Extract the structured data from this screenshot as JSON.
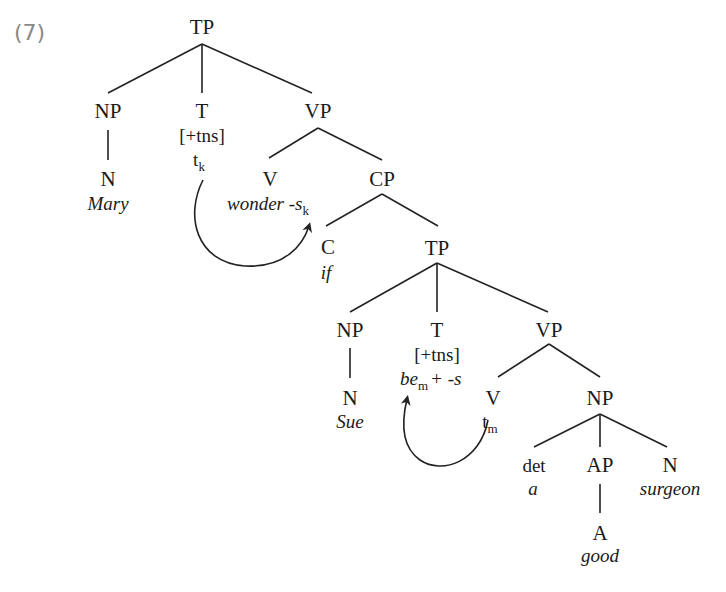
{
  "example": {
    "number": "(7)",
    "color": "#8a8a8a"
  },
  "tree": {
    "root": {
      "label": "TP"
    },
    "np1": {
      "label": "NP",
      "n": "N",
      "word": "Mary"
    },
    "t1": {
      "label": "T",
      "feature": "[+tns]",
      "trace": "t",
      "trace_index": "k"
    },
    "vp1": {
      "label": "VP"
    },
    "v1": {
      "label": "V",
      "word": "wonder -s",
      "word_index": "k"
    },
    "cp": {
      "label": "CP"
    },
    "c": {
      "label": "C",
      "word": "if"
    },
    "tp2": {
      "label": "TP"
    },
    "np2": {
      "label": "NP",
      "n": "N",
      "word": "Sue"
    },
    "t2": {
      "label": "T",
      "feature": "[+tns]",
      "word_be": "be",
      "word_index": "m",
      "word_suffix": "+ -s"
    },
    "vp2": {
      "label": "VP"
    },
    "v2": {
      "label": "V",
      "trace": "t",
      "trace_index": "m"
    },
    "np3": {
      "label": "NP"
    },
    "det": {
      "label": "det",
      "word": "a"
    },
    "ap": {
      "label": "AP",
      "a": "A",
      "word": "good"
    },
    "n3": {
      "label": "N",
      "word": "surgeon"
    }
  },
  "movements": [
    {
      "from": "t_k (T)",
      "to": "wonder -s_k (V)",
      "index": "k"
    },
    {
      "from": "t_m (V)",
      "to": "be_m + -s (T)",
      "index": "m"
    }
  ]
}
